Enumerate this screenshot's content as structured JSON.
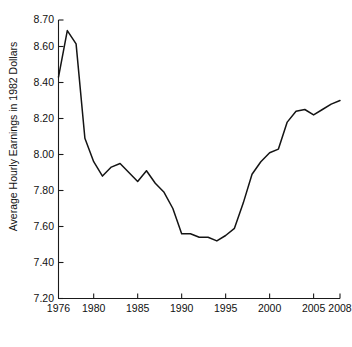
{
  "chart_data": {
    "type": "line",
    "title": "",
    "xlabel": "Year",
    "ylabel": "Average Hourly Earnings in 1982 Dollars",
    "xlim": [
      1976,
      2008
    ],
    "ylim": [
      7.2,
      8.7
    ],
    "grid": false,
    "legend": null,
    "xtick_labels": [
      "1976",
      "1980",
      "1985",
      "1990",
      "1995",
      "2000",
      "2005",
      "2008"
    ],
    "xtick_values": [
      1976,
      1980,
      1985,
      1990,
      1995,
      2000,
      2005,
      2008
    ],
    "ytick_labels": [
      "7.20",
      "7.40",
      "7.60",
      "7.80",
      "8.00",
      "8.20",
      "8.40",
      "8.60",
      "8.70"
    ],
    "ytick_values": [
      7.2,
      7.4,
      7.6,
      7.8,
      8.0,
      8.2,
      8.4,
      8.6,
      8.7
    ],
    "series": [
      {
        "name": "Average Hourly Earnings in 1982 Dollars",
        "color": "#141414",
        "x": [
          1976,
          1977,
          1978,
          1979,
          1980,
          1981,
          1982,
          1983,
          1984,
          1985,
          1986,
          1987,
          1988,
          1989,
          1990,
          1991,
          1992,
          1993,
          1994,
          1995,
          1996,
          1997,
          1998,
          1999,
          2000,
          2001,
          2002,
          2003,
          2004,
          2005,
          2006,
          2007,
          2008
        ],
        "y": [
          8.43,
          8.66,
          8.61,
          8.09,
          7.96,
          7.88,
          7.93,
          7.95,
          7.9,
          7.85,
          7.91,
          7.84,
          7.79,
          7.7,
          7.56,
          7.56,
          7.54,
          7.54,
          7.52,
          7.55,
          7.59,
          7.73,
          7.89,
          7.96,
          8.01,
          8.03,
          8.18,
          8.24,
          8.25,
          8.22,
          8.25,
          8.28,
          8.3
        ]
      }
    ]
  },
  "axes": {
    "y_axis_name": "y-axis",
    "x_axis_name": "x-axis"
  }
}
